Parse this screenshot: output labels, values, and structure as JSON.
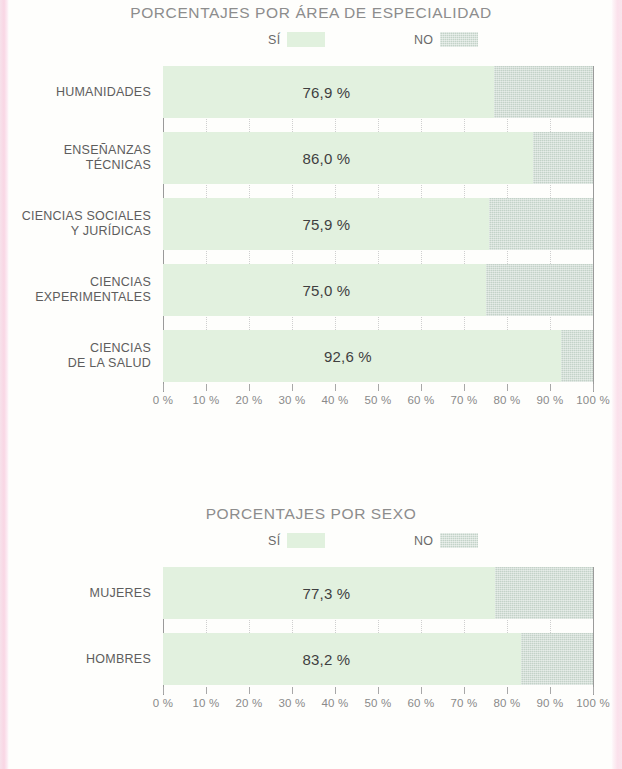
{
  "charts": [
    {
      "title": "PORCENTAJES POR ÁREA DE ESPECIALIDAD",
      "legend": [
        {
          "label": "SÍ",
          "swatch": "si-swatch"
        },
        {
          "label": "NO",
          "swatch": "no-swatch"
        }
      ],
      "axis_ticks": [
        "0 %",
        "10 %",
        "20 %",
        "30 %",
        "40 %",
        "50 %",
        "60 %",
        "70 %",
        "80 %",
        "90 %",
        "100 %"
      ],
      "rows": [
        {
          "label": "HUMANIDADES",
          "value_label": "76,9 %",
          "yes": 76.9,
          "no": 23.1
        },
        {
          "label": "ENSEÑANZAS\nTÉCNICAS",
          "value_label": "86,0 %",
          "yes": 86.0,
          "no": 14.0
        },
        {
          "label": "CIENCIAS SOCIALES\nY JURÍDICAS",
          "value_label": "75,9 %",
          "yes": 75.9,
          "no": 24.1
        },
        {
          "label": "CIENCIAS\nEXPERIMENTALES",
          "value_label": "75,0 %",
          "yes": 75.0,
          "no": 25.0
        },
        {
          "label": "CIENCIAS\nDE LA SALUD",
          "value_label": "92,6 %",
          "yes": 92.6,
          "no": 7.4
        }
      ]
    },
    {
      "title": "PORCENTAJES POR SEXO",
      "legend": [
        {
          "label": "SÍ",
          "swatch": "si-swatch"
        },
        {
          "label": "NO",
          "swatch": "no-swatch"
        }
      ],
      "axis_ticks": [
        "0 %",
        "10 %",
        "20 %",
        "30 %",
        "40 %",
        "50 %",
        "60 %",
        "70 %",
        "80 %",
        "90 %",
        "100 %"
      ],
      "rows": [
        {
          "label": "MUJERES",
          "value_label": "77,3 %",
          "yes": 77.3,
          "no": 22.7
        },
        {
          "label": "HOMBRES",
          "value_label": "83,2 %",
          "yes": 83.2,
          "no": 16.8
        }
      ]
    }
  ],
  "colors": {
    "yes_fill": "#e2f1df",
    "no_fill": "#c3d2c8",
    "title_text": "#8d8d8d",
    "label_text": "#5d5d5d",
    "value_text": "#3f3f3f",
    "axis": "#9a9a9a",
    "page_edge_pink": "#f8cfe0"
  },
  "chart_data": [
    {
      "type": "bar",
      "orientation": "horizontal",
      "stacked": true,
      "title": "PORCENTAJES POR ÁREA DE ESPECIALIDAD",
      "xlabel": "",
      "ylabel": "",
      "xlim": [
        0,
        100
      ],
      "xticks": [
        0,
        10,
        20,
        30,
        40,
        50,
        60,
        70,
        80,
        90,
        100
      ],
      "xticklabels": [
        "0 %",
        "10 %",
        "20 %",
        "30 %",
        "40 %",
        "50 %",
        "60 %",
        "70 %",
        "80 %",
        "90 %",
        "100 %"
      ],
      "grid": true,
      "legend": [
        "SÍ",
        "NO"
      ],
      "legend_position": "top-center",
      "categories": [
        "HUMANIDADES",
        "ENSEÑANZAS TÉCNICAS",
        "CIENCIAS SOCIALES Y JURÍDICAS",
        "CIENCIAS EXPERIMENTALES",
        "CIENCIAS DE LA SALUD"
      ],
      "series": [
        {
          "name": "SÍ",
          "values": [
            76.9,
            86.0,
            75.9,
            75.0,
            92.6
          ],
          "color": "#e2f1df"
        },
        {
          "name": "NO",
          "values": [
            23.1,
            14.0,
            24.1,
            25.0,
            7.4
          ],
          "color": "#c3d2c8"
        }
      ],
      "data_labels": [
        "76,9 %",
        "86,0 %",
        "75,9 %",
        "75,0 %",
        "92,6 %"
      ]
    },
    {
      "type": "bar",
      "orientation": "horizontal",
      "stacked": true,
      "title": "PORCENTAJES POR SEXO",
      "xlabel": "",
      "ylabel": "",
      "xlim": [
        0,
        100
      ],
      "xticks": [
        0,
        10,
        20,
        30,
        40,
        50,
        60,
        70,
        80,
        90,
        100
      ],
      "xticklabels": [
        "0 %",
        "10 %",
        "20 %",
        "30 %",
        "40 %",
        "50 %",
        "60 %",
        "70 %",
        "80 %",
        "90 %",
        "100 %"
      ],
      "grid": true,
      "legend": [
        "SÍ",
        "NO"
      ],
      "legend_position": "top-center",
      "categories": [
        "MUJERES",
        "HOMBRES"
      ],
      "series": [
        {
          "name": "SÍ",
          "values": [
            77.3,
            83.2
          ],
          "color": "#e2f1df"
        },
        {
          "name": "NO",
          "values": [
            22.7,
            16.8
          ],
          "color": "#c3d2c8"
        }
      ],
      "data_labels": [
        "77,3 %",
        "83,2 %"
      ]
    }
  ]
}
